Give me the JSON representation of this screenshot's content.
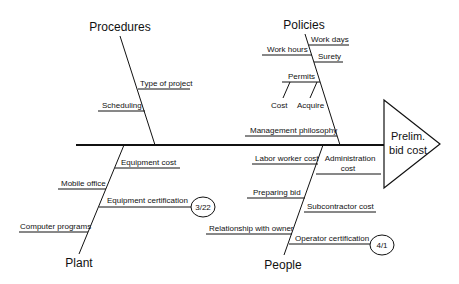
{
  "diagram": {
    "type": "fishbone",
    "effect": {
      "line1": "Prelim.",
      "line2": "bid cost"
    },
    "categories": {
      "procedures": {
        "label": "Procedures",
        "causes": [
          "Type of project",
          "Scheduling"
        ]
      },
      "policies": {
        "label": "Policies",
        "causes": [
          "Work days",
          "Work hours",
          "Surety",
          "Permits",
          "Management philosophy"
        ],
        "sub_causes": {
          "permits": [
            "Cost",
            "Acquire"
          ]
        }
      },
      "plant": {
        "label": "Plant",
        "causes": [
          "Equipment cost",
          "Mobile office",
          "Equipment certification",
          "Computer programs"
        ],
        "badges": {
          "equipment_certification": "3/22"
        }
      },
      "people": {
        "label": "People",
        "causes": [
          "Labor worker cost",
          "Administration",
          "cost",
          "Preparing bid",
          "Subcontractor cost",
          "Relationship with owner",
          "Operator certification"
        ],
        "badges": {
          "operator_certification": "4/1"
        }
      }
    }
  }
}
